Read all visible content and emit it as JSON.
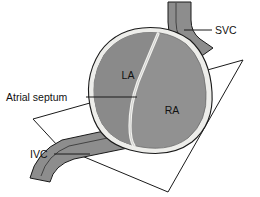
{
  "figure": {
    "width": 260,
    "height": 197,
    "background_color": "#ffffff"
  },
  "labels": {
    "svc": "SVC",
    "ivc": "IVC",
    "atrial_septum": "Atrial septum",
    "left_atrium": "LA",
    "right_atrium": "RA"
  },
  "colors": {
    "outline": "#1a1a1a",
    "epicardium_rim": "#ededea",
    "left_atrium_fill": "#8a8a8a",
    "right_atrium_fill": "#919191",
    "vessel_fill": "#8d8d8d",
    "vessel_rim": "#e8e8e5",
    "septum_line": "#f2f2ef",
    "label_text": "#111111",
    "leader_line": "#1a1a1a"
  },
  "geometry": {
    "plane_vertices": "33,119 243,60 168,192 58,146",
    "svc_outer": "M 168 2 L 168 22 Q 168 40 181 50 L 196 60 L 213 48 L 200 39 Q 191 32 191 20 L 191 2 Z",
    "svc_inner_line": "M 176 3 L 176 22 Q 176 38 188 47 L 203 56",
    "ivc_outer": "M 30 178 Q 36 152 62 140 L 118 128 L 128 148 L 74 159 Q 54 165 50 182 Z",
    "ivc_inner_line": "M 41 176 Q 47 155 69 146 L 122 135",
    "heart_rim": "M 160 28 Q 120 24 100 52 Q 82 80 92 114 Q 100 142 130 150 Q 168 160 192 142 Q 214 124 212 92 Q 210 58 190 40 Q 176 30 160 28 Z",
    "heart_body": "M 160 33 Q 123 29 104 55 Q 88 81 97 112 Q 105 138 132 145 Q 167 154 188 138 Q 208 121 206 92 Q 204 60 186 44 Q 174 35 160 33 Z",
    "septum_path": "M 158 34 Q 147 60 138 82 Q 130 104 130 126 Q 130 140 134 146",
    "ra_scallops": "M 206 80 q 5 5 -1 10 q -5 5 1 10 q 5 5 -1 10 q -5 5 0 10"
  },
  "callouts": [
    {
      "id": "svc",
      "text_x": 215,
      "text_y": 34,
      "line": "M 212 30 L 184 30"
    },
    {
      "id": "atrial_septum",
      "text_x": 6,
      "text_y": 101,
      "line": "M 86 97 L 137 97"
    },
    {
      "id": "ivc",
      "text_x": 30,
      "text_y": 158,
      "line": "M 54 154 L 90 154"
    }
  ],
  "chamber_positions": {
    "la": {
      "x": 128,
      "y": 79
    },
    "ra": {
      "x": 172,
      "y": 114
    }
  }
}
